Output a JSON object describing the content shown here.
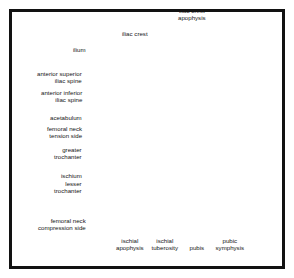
{
  "figure": {
    "view": "anteroposterior radiographic schematic of the pelvis",
    "frame_color": "#121212",
    "background_color": "#ffffff",
    "soft_tissue_color": "#a9a9a9",
    "bone_color": "#d9d9d4",
    "bone_light_color": "#e7e7e2",
    "foramen_color": "#8f8f8f",
    "outline_color": "#6b6b6b",
    "leader_color": "#141414"
  },
  "labels": [
    {
      "id": "iliac-crest-apophysis",
      "text": "iliac crest\napophysis",
      "align": "center",
      "x": 192,
      "y": 15
    },
    {
      "id": "iliac-crest",
      "text": "iliac crest",
      "align": "center",
      "x": 135,
      "y": 34
    },
    {
      "id": "ilium",
      "text": "ilium",
      "align": "right",
      "x": 86,
      "y": 50
    },
    {
      "id": "anterior-superior-iliac-spine",
      "text": "anterior superior\niliac spine",
      "align": "right",
      "x": 82,
      "y": 78
    },
    {
      "id": "anterior-inferior-iliac-spine",
      "text": "anterior inferior\niliac spine",
      "align": "right",
      "x": 82,
      "y": 97
    },
    {
      "id": "acetabulum",
      "text": "acetabulum",
      "align": "right",
      "x": 82,
      "y": 118
    },
    {
      "id": "femoral-neck-tension-side",
      "text": "femoral neck\ntension side",
      "align": "right",
      "x": 82,
      "y": 133
    },
    {
      "id": "greater-trochanter",
      "text": "greater\ntrochanter",
      "align": "right",
      "x": 82,
      "y": 154
    },
    {
      "id": "ischium",
      "text": "ischium",
      "align": "right",
      "x": 82,
      "y": 176
    },
    {
      "id": "lesser-trochanter",
      "text": "lesser\ntrochanter",
      "align": "right",
      "x": 82,
      "y": 188
    },
    {
      "id": "femoral-neck-compression-side",
      "text": "femoral neck\ncompression side",
      "align": "right",
      "x": 86,
      "y": 225
    },
    {
      "id": "ischial-apophysis",
      "text": "ischial\napophysis",
      "align": "center",
      "x": 130,
      "y": 245
    },
    {
      "id": "ischial-tuberosity",
      "text": "ischial\ntuberosity",
      "align": "center",
      "x": 165,
      "y": 245
    },
    {
      "id": "pubis",
      "text": "pubis",
      "align": "center",
      "x": 197,
      "y": 248
    },
    {
      "id": "pubic-symphysis",
      "text": "pubic\nsymphysis",
      "align": "center",
      "x": 230,
      "y": 245
    }
  ],
  "leaders": [
    {
      "id": "leader-iliac-crest-apophysis",
      "points": "192,30 192,66"
    },
    {
      "id": "leader-iliac-crest",
      "points": "139,42 153,72"
    },
    {
      "id": "leader-ilium",
      "points": "89,52 141,88"
    },
    {
      "id": "leader-anterior-superior-iliac-spine",
      "points": "85,81 134,98"
    },
    {
      "id": "leader-anterior-inferior-iliac-spine",
      "points": "85,100 130,117"
    },
    {
      "id": "leader-acetabulum",
      "points": "85,119 142,130"
    },
    {
      "id": "leader-femoral-neck-tension-side",
      "points": "85,137 131,152"
    },
    {
      "id": "leader-greater-trochanter",
      "points": "85,157 127,157"
    },
    {
      "id": "leader-ischium",
      "points": "85,177 148,166"
    },
    {
      "id": "leader-lesser-trochanter",
      "points": "85,191 133,176"
    },
    {
      "id": "leader-femoral-neck-compression-side",
      "points": "89,219 136,180"
    },
    {
      "id": "leader-ischial-apophysis",
      "points": "130,236 143,206"
    },
    {
      "id": "leader-ischial-tuberosity",
      "points": "165,236 170,196"
    },
    {
      "id": "leader-pubis",
      "points": "197,239 200,174"
    },
    {
      "id": "leader-pubic-symphysis",
      "points": "230,236 209,172"
    }
  ]
}
